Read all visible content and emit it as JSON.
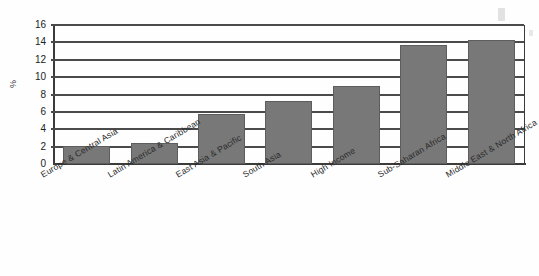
{
  "chart_data": {
    "type": "bar",
    "title": "",
    "xlabel": "",
    "ylabel": "%",
    "ylim": [
      0,
      16
    ],
    "ytick_step": 2,
    "yticks": [
      16,
      14,
      12,
      10,
      8,
      6,
      4,
      2,
      0
    ],
    "grid": true,
    "legend": "none",
    "orientation": "vertical",
    "bar_color": "#787878",
    "bar_edge_color": "#5d5d5d",
    "axis_color": "#3b3b3b",
    "gridline_color": "#4a4a4a",
    "categories": [
      "Europe & Central Asia",
      "Latin America & Caribbean",
      "East Asia & Pacific",
      "South Asia",
      "High Income",
      "Sub-Saharan Africa",
      "Middle East & North Africa"
    ],
    "values": [
      2.1,
      2.4,
      5.7,
      7.2,
      9.0,
      13.7,
      14.3
    ]
  }
}
